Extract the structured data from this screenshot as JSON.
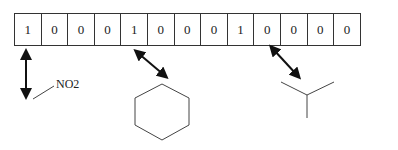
{
  "bit_vector": {
    "cells": [
      "1",
      "0",
      "0",
      "0",
      "1",
      "0",
      "0",
      "0",
      "1",
      "0",
      "0",
      "0",
      "0"
    ]
  },
  "fragments": [
    {
      "name": "nitro-group",
      "label": "NO2",
      "mapped_bit_index": 0
    },
    {
      "name": "benzene-ring",
      "label": "",
      "mapped_bit_index": 4
    },
    {
      "name": "branch-point",
      "label": "",
      "mapped_bit_index": 8
    }
  ],
  "colors": {
    "line": "#333333",
    "arrow": "#111111"
  }
}
